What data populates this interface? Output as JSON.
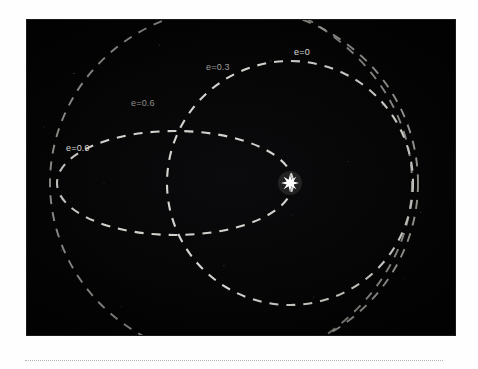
{
  "figure": {
    "name": "orbital-eccentricity-diagram",
    "caption_rule_present": true,
    "background_color": "#ffffff",
    "plate_color": "#060607",
    "plate": {
      "x": 27,
      "y": 20,
      "width": 428,
      "height": 315
    }
  },
  "star": {
    "name": "central-star",
    "label": "",
    "color": "#ffffff",
    "points": 8,
    "cx": 263,
    "cy": 163,
    "radius_outer": 9,
    "radius_inner": 3.6
  },
  "chart_data": {
    "type": "scatter",
    "title": "",
    "subtitle": "",
    "xlabel": "",
    "ylabel": "",
    "grid": false,
    "legend_position": "inline-annotations",
    "focus": {
      "x": 263,
      "y": 163
    },
    "perihelion": {
      "x": 273,
      "y": 163
    },
    "xlim": [
      0,
      428
    ],
    "ylim": [
      0,
      315
    ],
    "series": [
      {
        "name": "e=0",
        "label": "e=0",
        "eccentricity": 0,
        "color": "#e6e6e0",
        "opacity": 0.92,
        "stroke_width": 2.1,
        "dash": "9 8",
        "cx": 263,
        "cy": 163,
        "rx": 123,
        "ry": 122,
        "label_x": 267,
        "label_y": 27,
        "label_color": "#dcdcd6"
      },
      {
        "name": "e=0.3",
        "label": "e=0.3",
        "eccentricity": 0.3,
        "color": "#c9c9c2",
        "opacity": 0.78,
        "stroke_width": 1.9,
        "dash": "9 8",
        "cx": 207,
        "cy": 163,
        "rx": 184,
        "ry": 176,
        "label_x": 179,
        "label_y": 42,
        "label_color": "#9e9e98"
      },
      {
        "name": "e=0.6",
        "label": "e=0.6",
        "eccentricity": 0.6,
        "color": "#c2c2bb",
        "opacity": 0.74,
        "stroke_width": 1.9,
        "dash": "9 8",
        "cx": 133,
        "cy": 163,
        "rx": 252,
        "ry": 202,
        "label_x": 104,
        "label_y": 78,
        "label_color": "#8f8f8a"
      },
      {
        "name": "e=0.9",
        "label": "e=0.9",
        "eccentricity": 0.9,
        "color": "#e2e2dc",
        "opacity": 0.93,
        "stroke_width": 2.1,
        "dash": "9 8",
        "cx": 148,
        "cy": 163,
        "rx": 118,
        "ry": 52,
        "label_x": 39,
        "label_y": 123,
        "label_color": "#d6d6d0"
      }
    ]
  }
}
